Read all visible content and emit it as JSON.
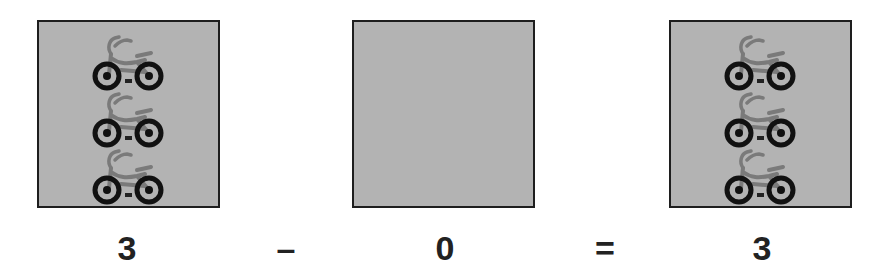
{
  "equation": {
    "operands": [
      {
        "label": "3",
        "count": 3,
        "icon": "bicycle-icon"
      },
      {
        "label": "0",
        "count": 0,
        "icon": "bicycle-icon"
      },
      {
        "label": "3",
        "count": 3,
        "icon": "bicycle-icon"
      }
    ],
    "operator": "–",
    "equals": "="
  },
  "colors": {
    "box_fill": "#b3b3b3",
    "box_border": "#1e1e1e",
    "bike_frame": "#7a7a7a",
    "wheel": "#111111",
    "text": "#222222"
  }
}
